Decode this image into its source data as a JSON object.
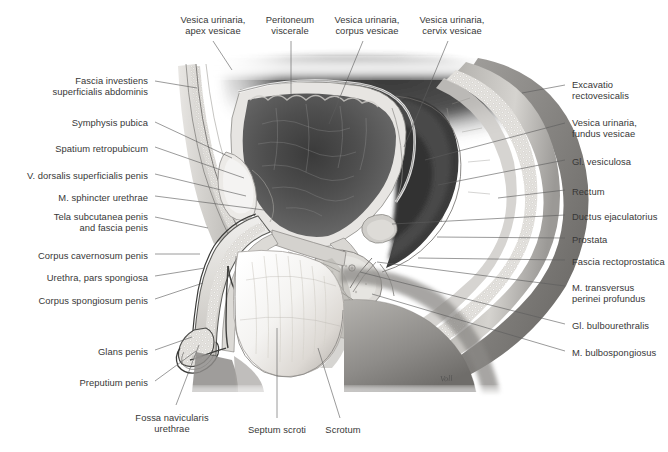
{
  "figure": {
    "artist_signature": "Voll",
    "background_color": "#ffffff",
    "leader_color": "#5c5c5c",
    "text_color": "#383838",
    "footer_note": ""
  },
  "labels_top": [
    {
      "id": "vesica-apex",
      "text": "Vesica urinaria,\napex vesicae",
      "x": 213,
      "y": 14,
      "anchor": "center"
    },
    {
      "id": "peritoneum",
      "text": "Peritoneum\nviscerale",
      "x": 290,
      "y": 14,
      "anchor": "center"
    },
    {
      "id": "vesica-corpus",
      "text": "Vesica urinaria,\ncorpus vesicae",
      "x": 367,
      "y": 14,
      "anchor": "center"
    },
    {
      "id": "vesica-cervix",
      "text": "Vesica urinaria,\ncervix vesicae",
      "x": 452,
      "y": 14,
      "anchor": "center"
    }
  ],
  "labels_left": [
    {
      "id": "fascia-investiens",
      "text": "Fascia investiens\nsuperficialis abdominis",
      "x": 148,
      "y": 75
    },
    {
      "id": "symphysis-pubica",
      "text": "Symphysis pubica",
      "x": 148,
      "y": 117
    },
    {
      "id": "spatium-retro",
      "text": "Spatium retropubicum",
      "x": 148,
      "y": 143
    },
    {
      "id": "v-dorsalis",
      "text": "V. dorsalis superficialis penis",
      "x": 148,
      "y": 170
    },
    {
      "id": "m-sphincter",
      "text": "M. sphincter urethrae",
      "x": 148,
      "y": 192
    },
    {
      "id": "tela-subcutanea",
      "text": "Tela subcutanea penis\nand fascia penis",
      "x": 148,
      "y": 211
    },
    {
      "id": "corpus-cavernosum",
      "text": "Corpus cavernosum penis",
      "x": 148,
      "y": 250
    },
    {
      "id": "urethra-spongiosa",
      "text": "Urethra, pars spongiosa",
      "x": 148,
      "y": 272
    },
    {
      "id": "corpus-spongiosum",
      "text": "Corpus spongiosum penis",
      "x": 148,
      "y": 295
    },
    {
      "id": "glans-penis",
      "text": "Glans penis",
      "x": 148,
      "y": 346
    },
    {
      "id": "preputium-penis",
      "text": "Preputium penis",
      "x": 148,
      "y": 377
    }
  ],
  "labels_right": [
    {
      "id": "excavatio-rectovesicalis",
      "text": "Excavatio\nrectovesicalis",
      "x": 572,
      "y": 79
    },
    {
      "id": "vesica-fundus",
      "text": "Vesica urinaria,\nfundus vesicae",
      "x": 572,
      "y": 117
    },
    {
      "id": "gl-vesiculosa",
      "text": "Gl. vesiculosa",
      "x": 572,
      "y": 156
    },
    {
      "id": "rectum",
      "text": "Rectum",
      "x": 572,
      "y": 186
    },
    {
      "id": "ductus-ejaculatorius",
      "text": "Ductus ejaculatorius",
      "x": 572,
      "y": 211
    },
    {
      "id": "prostata",
      "text": "Prostata",
      "x": 572,
      "y": 234
    },
    {
      "id": "fascia-rectoprostatica",
      "text": "Fascia rectoprostatica",
      "x": 572,
      "y": 256
    },
    {
      "id": "m-transversus",
      "text": "M. transversus\nperinei profundus",
      "x": 572,
      "y": 282
    },
    {
      "id": "gl-bulbourethralis",
      "text": "Gl. bulbourethralis",
      "x": 572,
      "y": 320
    },
    {
      "id": "m-bulbospongiosus",
      "text": "M. bulbospongiosus",
      "x": 572,
      "y": 347
    }
  ],
  "labels_bottom": [
    {
      "id": "fossa-navicularis",
      "text": "Fossa navicularis\nurethrae",
      "x": 172,
      "y": 412,
      "anchor": "center"
    },
    {
      "id": "septum-scroti",
      "text": "Septum scroti",
      "x": 277,
      "y": 424,
      "anchor": "center"
    },
    {
      "id": "scrotum",
      "text": "Scrotum",
      "x": 343,
      "y": 424,
      "anchor": "center"
    }
  ],
  "leaders_top": [
    {
      "id": "leader-vesica-apex",
      "d": "M 213 41 L 232 70"
    },
    {
      "id": "leader-peritoneum",
      "d": "M 291 41 L 291 96"
    },
    {
      "id": "leader-vesica-corpus",
      "d": "M 363 41 L 329 124"
    },
    {
      "id": "leader-vesica-cervix",
      "d": "M 448 41 L 404 147"
    }
  ],
  "leaders_left": [
    {
      "id": "leader-fascia-investiens",
      "d": "M 155 81 L 197 88"
    },
    {
      "id": "leader-symphysis-pubica",
      "d": "M 155 122 L 232 158"
    },
    {
      "id": "leader-spatium-retro",
      "d": "M 155 147 L 244 178"
    },
    {
      "id": "leader-v-dorsalis",
      "d": "M 155 174 L 246 196"
    },
    {
      "id": "leader-m-sphincter",
      "d": "M 155 196 L 264 210"
    },
    {
      "id": "leader-tela-subcutanea",
      "d": "M 155 217 L 208 228"
    },
    {
      "id": "leader-corpus-cavernosum",
      "d": "M 155 254 L 200 254"
    },
    {
      "id": "leader-urethra-spongiosa",
      "d": "M 155 276 L 205 268"
    },
    {
      "id": "leader-corpus-spongiosum",
      "d": "M 155 299 L 203 283"
    },
    {
      "id": "leader-glans-penis",
      "d": "M 155 350 L 192 337"
    },
    {
      "id": "leader-preputium-penis",
      "d": "M 155 381 L 196 351"
    }
  ],
  "leaders_right": [
    {
      "id": "leader-excavatio",
      "d": "M 565 85 L 522 93"
    },
    {
      "id": "leader-vesica-fundus",
      "d": "M 565 123 L 425 160"
    },
    {
      "id": "leader-gl-vesiculosa",
      "d": "M 565 160 L 438 185"
    },
    {
      "id": "leader-rectum",
      "d": "M 565 190 L 498 198"
    },
    {
      "id": "leader-ductus",
      "d": "M 565 215 L 392 224"
    },
    {
      "id": "leader-prostata",
      "d": "M 565 238 L 437 237"
    },
    {
      "id": "leader-fascia-recto",
      "d": "M 565 260 L 418 258"
    },
    {
      "id": "leader-m-transversus",
      "d": "M 565 286 L 377 262"
    },
    {
      "id": "leader-gl-bulbo",
      "d": "M 565 324 L 360 272"
    },
    {
      "id": "leader-m-bulbo",
      "d": "M 565 351 L 372 294"
    }
  ],
  "leaders_bottom": [
    {
      "id": "leader-fossa-navicularis",
      "d": "M 176 405 L 199 345"
    },
    {
      "id": "leader-septum-scroti",
      "d": "M 277 418 L 277 328"
    },
    {
      "id": "leader-scrotum",
      "d": "M 340 418 L 318 348"
    }
  ]
}
